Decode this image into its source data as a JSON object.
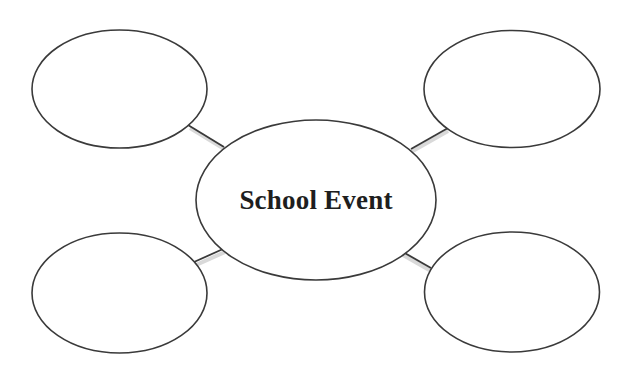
{
  "diagram": {
    "type": "bubble-map",
    "center": {
      "label": "School Event"
    },
    "branches": [
      {
        "position": "top-left",
        "label": ""
      },
      {
        "position": "top-right",
        "label": ""
      },
      {
        "position": "bottom-left",
        "label": ""
      },
      {
        "position": "bottom-right",
        "label": ""
      }
    ],
    "colors": {
      "background": "#ffffff",
      "stroke": "#3a3a3a",
      "text": "#1e1e1e"
    }
  }
}
